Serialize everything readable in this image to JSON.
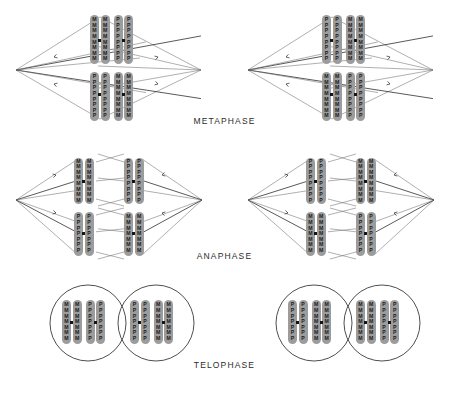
{
  "figure": {
    "colors": {
      "chromosome_fill": "#9c9c9c",
      "chromosome_letter": "#1b1b1b",
      "centromere": "#141414",
      "spindle_fiber": "#6e6e6e",
      "spindle_fiber_dark": "#222222",
      "cell_outline": "#3a3a3a",
      "background": "#ffffff"
    },
    "letters": {
      "maternal": "M",
      "paternal": "P"
    }
  },
  "rows": [
    {
      "id": "metaphase",
      "label": "METAPHASE"
    },
    {
      "id": "anaphase",
      "label": "ANAPHASE"
    },
    {
      "id": "telophase",
      "label": "TELOPHASE"
    }
  ],
  "metaphase": {
    "label": "METAPHASE",
    "cells": [
      {
        "id": "metaphase-cell-1",
        "top_group": [
          "M",
          "M",
          "P",
          "P"
        ],
        "bottom_group": [
          "P",
          "P",
          "M",
          "M"
        ]
      },
      {
        "id": "metaphase-cell-2",
        "top_group": [
          "P",
          "P",
          "M",
          "M"
        ],
        "bottom_group": [
          "M",
          "M",
          "P",
          "P"
        ]
      }
    ]
  },
  "anaphase": {
    "label": "ANAPHASE",
    "cells": [
      {
        "id": "anaphase-cell-1",
        "left_half": {
          "top_group": [
            "M",
            "M"
          ],
          "bottom_group": [
            "P",
            "P"
          ]
        },
        "right_half": {
          "top_group": [
            "P",
            "P"
          ],
          "bottom_group": [
            "M",
            "M"
          ]
        }
      },
      {
        "id": "anaphase-cell-2",
        "left_half": {
          "top_group": [
            "P",
            "P"
          ],
          "bottom_group": [
            "M",
            "M"
          ]
        },
        "right_half": {
          "top_group": [
            "M",
            "M"
          ],
          "bottom_group": [
            "P",
            "P"
          ]
        }
      }
    ]
  },
  "telophase": {
    "label": "TELOPHASE",
    "cells": [
      {
        "id": "telophase-cell-1",
        "left_nucleus": [
          "M",
          "M",
          "P",
          "P"
        ],
        "right_nucleus": [
          "P",
          "P",
          "M",
          "M"
        ]
      },
      {
        "id": "telophase-cell-2",
        "left_nucleus": [
          "P",
          "P",
          "M",
          "M"
        ],
        "right_nucleus": [
          "M",
          "M",
          "P",
          "P"
        ]
      }
    ]
  },
  "labels": {
    "metaphase": "METAPHASE",
    "anaphase": "ANAPHASE",
    "telophase": "TELOPHASE"
  }
}
